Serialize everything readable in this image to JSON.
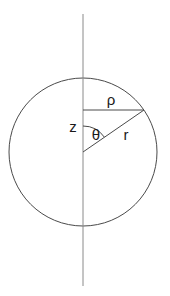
{
  "figure": {
    "background_color": "#ffffff",
    "stroke_color": "#4a4a4a",
    "axis_color": "#8a8a8a",
    "label_color": "#1a1a1a",
    "stroke_width": 1
  },
  "labels": {
    "rho": "ρ",
    "z": "z",
    "theta": "θ",
    "r": "r"
  },
  "geometry": {
    "circle": {
      "center_x": 83,
      "center_y": 152,
      "radius": 74
    },
    "vertical_axis": {
      "x": 83,
      "y_top": 14,
      "y_bottom": 286
    },
    "rho_segment": {
      "x1": 83,
      "y1": 110,
      "x2": 144,
      "y2": 110
    },
    "r_segment": {
      "x1": 83,
      "y1": 152,
      "x2": 144,
      "y2": 110
    },
    "theta_arc": {
      "center_x": 83,
      "center_y": 152,
      "radius": 26,
      "start_angle_deg": 270,
      "end_angle_deg": 325
    },
    "label_positions": {
      "rho": {
        "x": 111,
        "y": 105
      },
      "z": {
        "x": 73,
        "y": 132
      },
      "theta": {
        "x": 96,
        "y": 140
      },
      "r": {
        "x": 126,
        "y": 140
      }
    }
  }
}
